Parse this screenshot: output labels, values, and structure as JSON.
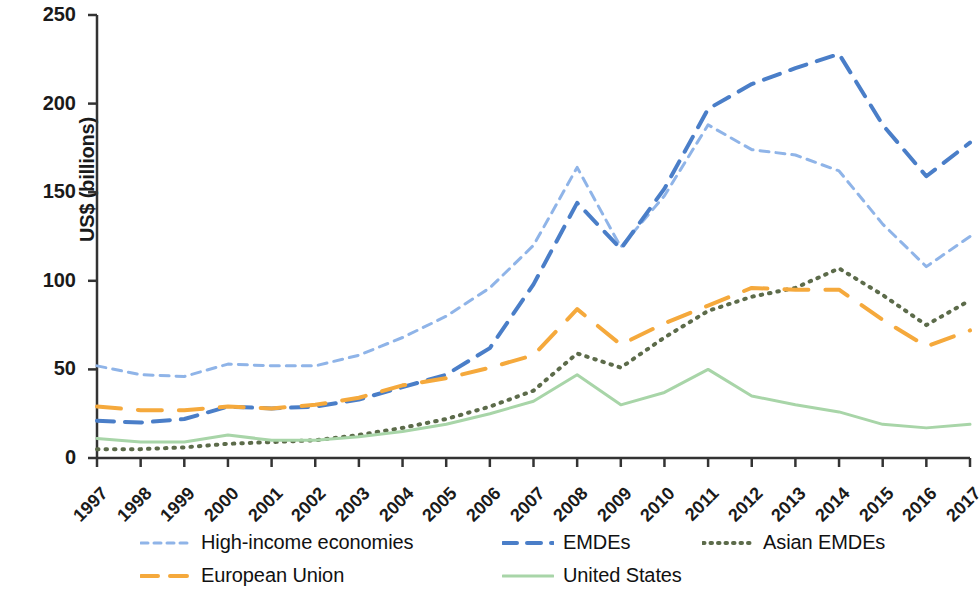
{
  "chart_data": {
    "type": "line",
    "title": "",
    "xlabel": "",
    "ylabel": "US$ (billions)",
    "x": [
      1997,
      1998,
      1999,
      2000,
      2001,
      2002,
      2003,
      2004,
      2005,
      2006,
      2007,
      2008,
      2009,
      2010,
      2011,
      2012,
      2013,
      2014,
      2015,
      2016,
      2017
    ],
    "xticklabels": [
      "1997",
      "1998",
      "1999",
      "2000",
      "2001",
      "2002",
      "2003",
      "2004",
      "2005",
      "2006",
      "2007",
      "2008",
      "2009",
      "2010",
      "2011",
      "2012",
      "2013",
      "2014",
      "2015",
      "2016",
      "2017"
    ],
    "yticks": [
      0,
      50,
      100,
      150,
      200,
      250
    ],
    "yticklabels": [
      "0",
      "50",
      "100",
      "150",
      "200",
      "250"
    ],
    "ylim": [
      0,
      250
    ],
    "xlim": [
      1997,
      2017
    ],
    "grid": false,
    "legend_position": "below-axes",
    "series": [
      {
        "name": "High-income economies",
        "color": "#8FB4E8",
        "style": "dashed",
        "dash": "9,7",
        "width": 3,
        "values": [
          52,
          47,
          46,
          53,
          52,
          52,
          58,
          68,
          80,
          96,
          120,
          164,
          119,
          148,
          188,
          174,
          171,
          162,
          132,
          108,
          125
        ]
      },
      {
        "name": "EMDEs",
        "color": "#4A7EC8",
        "style": "dashed",
        "dash": "17,11",
        "width": 4,
        "values": [
          21,
          20,
          22,
          29,
          28,
          29,
          33,
          40,
          47,
          62,
          98,
          144,
          118,
          152,
          197,
          211,
          220,
          228,
          188,
          159,
          178
        ]
      },
      {
        "name": "Asian EMDEs",
        "color": "#5C6B4A",
        "style": "dotted",
        "dash": "1.5,7",
        "width": 4,
        "values": [
          5,
          5,
          6,
          8,
          9,
          10,
          13,
          17,
          22,
          29,
          38,
          59,
          51,
          68,
          83,
          91,
          96,
          107,
          92,
          75,
          89
        ]
      },
      {
        "name": "European Union",
        "color": "#F5A93C",
        "style": "dashed",
        "dash": "24,17",
        "width": 4,
        "values": [
          29,
          27,
          27,
          29,
          28,
          30,
          34,
          41,
          45,
          51,
          58,
          84,
          64,
          76,
          86,
          96,
          95,
          95,
          78,
          63,
          72
        ]
      },
      {
        "name": "United States",
        "color": "#A8D5A8",
        "style": "solid",
        "dash": "none",
        "width": 3,
        "values": [
          11,
          9,
          9,
          13,
          10,
          10,
          12,
          15,
          19,
          25,
          32,
          47,
          30,
          37,
          50,
          35,
          30,
          26,
          19,
          17,
          19
        ]
      }
    ]
  },
  "axis": {
    "ylabel": "US$ (billions)"
  },
  "legend": {
    "items": [
      {
        "label": "High-income economies",
        "color": "#8FB4E8",
        "dash": "7,6",
        "width": 3
      },
      {
        "label": "EMDEs",
        "color": "#4A7EC8",
        "dash": "14,10",
        "width": 4
      },
      {
        "label": "Asian EMDEs",
        "color": "#5C6B4A",
        "dash": "1.5,6",
        "width": 4
      },
      {
        "label": "European Union",
        "color": "#F5A93C",
        "dash": "17,12",
        "width": 4
      },
      {
        "label": "United States",
        "color": "#A8D5A8",
        "dash": "none",
        "width": 3
      }
    ]
  }
}
